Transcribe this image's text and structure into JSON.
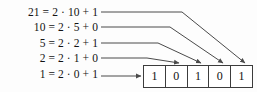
{
  "figure": {
    "line_color": "#4a4a4a",
    "box_border_color": "#3c3c3c",
    "text_color": "#131313",
    "background": "#fdfdfd"
  },
  "equations": [
    {
      "id": "eq-21",
      "text": "21 = 2 · 10 + 1",
      "dividend": 21,
      "quotient": 10,
      "remainder": 1
    },
    {
      "id": "eq-10",
      "text": "10 = 2 · 5 + 0",
      "dividend": 10,
      "quotient": 5,
      "remainder": 0
    },
    {
      "id": "eq-5",
      "text": "5 = 2 · 2 + 1",
      "dividend": 5,
      "quotient": 2,
      "remainder": 1
    },
    {
      "id": "eq-2",
      "text": "2 = 2 · 1 + 0",
      "dividend": 2,
      "quotient": 1,
      "remainder": 0
    },
    {
      "id": "eq-1",
      "text": "1 = 2 · 0 + 1",
      "dividend": 1,
      "quotient": 0,
      "remainder": 1
    }
  ],
  "bits": [
    {
      "index": 0,
      "value": "1"
    },
    {
      "index": 1,
      "value": "0"
    },
    {
      "index": 2,
      "value": "1"
    },
    {
      "index": 3,
      "value": "0"
    },
    {
      "index": 4,
      "value": "1"
    }
  ]
}
